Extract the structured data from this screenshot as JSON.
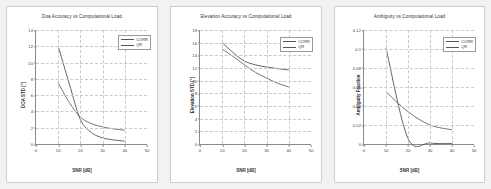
{
  "figure": {
    "background_color": "#f2f2f2",
    "panel_color": "#ffffff",
    "series_colors": {
      "CORR": "#555555",
      "QR": "#666666"
    },
    "grid_color": "#c9c9c9",
    "axis_color": "#8a8a8a"
  },
  "chart_data": [
    {
      "type": "line",
      "title": "Doa Accuracy vs Computational Load",
      "xlabel": "SNR [dB]",
      "ylabel": "DOA STD [°]",
      "xlim": [
        0,
        50
      ],
      "ylim": [
        0,
        14
      ],
      "xticks": [
        0,
        10,
        20,
        30,
        40,
        50
      ],
      "yticks": [
        0,
        2,
        4,
        6,
        8,
        10,
        12,
        14
      ],
      "xtick_labels": [
        "0",
        "10",
        "20",
        "30",
        "40",
        "50"
      ],
      "ytick_labels": [
        "0",
        "2",
        "4",
        "6",
        "8",
        "10",
        "12",
        "14"
      ],
      "grid": true,
      "legend_position": "upper right",
      "legend": [
        "CORR",
        "QR"
      ],
      "x": [
        10,
        15,
        20,
        25,
        30,
        35,
        40
      ],
      "series": [
        {
          "name": "CORR",
          "values": [
            12.0,
            7.4,
            3.0,
            1.4,
            0.75,
            0.5,
            0.35
          ]
        },
        {
          "name": "QR",
          "values": [
            7.5,
            5.1,
            3.3,
            2.5,
            2.1,
            1.85,
            1.7
          ]
        }
      ]
    },
    {
      "type": "line",
      "title": "Elevation Accuracy vs Computational Load",
      "xlabel": "SNR [dB]",
      "ylabel": "Elevation STD [°]",
      "xlim": [
        0,
        50
      ],
      "ylim": [
        0,
        18
      ],
      "xticks": [
        0,
        10,
        20,
        30,
        40,
        50
      ],
      "yticks": [
        0,
        2,
        4,
        6,
        8,
        10,
        12,
        14,
        16,
        18
      ],
      "xtick_labels": [
        "0",
        "10",
        "20",
        "30",
        "40",
        "50"
      ],
      "ytick_labels": [
        "0",
        "2",
        "4",
        "6",
        "8",
        "10",
        "12",
        "14",
        "16",
        "18"
      ],
      "grid": true,
      "legend_position": "upper right",
      "legend": [
        "CORR",
        "QR"
      ],
      "x": [
        10,
        15,
        20,
        25,
        30,
        35,
        40
      ],
      "series": [
        {
          "name": "CORR",
          "values": [
            16.0,
            14.4,
            13.1,
            12.5,
            12.15,
            11.9,
            11.7
          ]
        },
        {
          "name": "QR",
          "values": [
            15.0,
            13.8,
            12.5,
            11.3,
            10.4,
            9.6,
            9.0
          ]
        }
      ]
    },
    {
      "type": "line",
      "title": "Ambiguity vs Computational Load",
      "xlabel": "SNR [dB]",
      "ylabel": "Ambiguity Fraction",
      "xlim": [
        0,
        50
      ],
      "ylim": [
        0,
        0.12
      ],
      "xticks": [
        0,
        10,
        20,
        30,
        40,
        50
      ],
      "yticks": [
        0,
        0.02,
        0.04,
        0.06,
        0.08,
        0.1,
        0.12
      ],
      "xtick_labels": [
        "0",
        "10",
        "20",
        "30",
        "40",
        "50"
      ],
      "ytick_labels": [
        "0",
        "0.02",
        "0.04",
        "0.06",
        "0.08",
        "0.1",
        "0.12"
      ],
      "grid": true,
      "legend_position": "upper right",
      "legend": [
        "CORR",
        "QR"
      ],
      "x": [
        10,
        20,
        30,
        40
      ],
      "series": [
        {
          "name": "CORR",
          "values": [
            0.101,
            0.006,
            0.001,
            0.0005
          ]
        },
        {
          "name": "QR",
          "values": [
            0.055,
            0.034,
            0.02,
            0.015
          ]
        }
      ]
    }
  ]
}
